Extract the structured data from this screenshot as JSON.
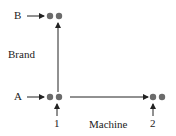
{
  "diagram": {
    "nodes": [
      {
        "id": "B",
        "label": "B"
      },
      {
        "id": "A",
        "label": "A"
      }
    ],
    "axes": {
      "vertical_label": "Brand",
      "horizontal_label": "Machine"
    },
    "ticks": {
      "first": "1",
      "second": "2"
    },
    "colors": {
      "dot": "#6b6b6b",
      "line": "#222222"
    }
  }
}
